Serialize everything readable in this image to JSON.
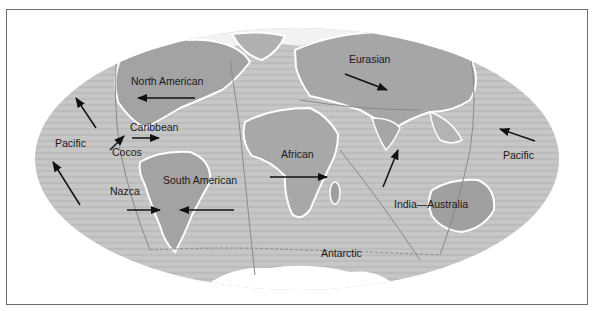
{
  "map": {
    "title": "",
    "projection": "elliptical world map of tectonic plates",
    "colors": {
      "frame_border": "#6e6e6e",
      "ocean_floor": "#c9c9c9",
      "continent": "#a9a9a9",
      "ice": "#ffffff",
      "arrow": "#111111",
      "label": "#1a1a1a"
    },
    "plates": [
      {
        "name": "North American",
        "label": "North American"
      },
      {
        "name": "Eurasian",
        "label": "Eurasian"
      },
      {
        "name": "Caribbean",
        "label": "Caribbean"
      },
      {
        "name": "Cocos",
        "label": "Cocos"
      },
      {
        "name": "Pacific (west)",
        "label": "Pacific"
      },
      {
        "name": "Pacific (east)",
        "label": "Pacific"
      },
      {
        "name": "Nazca",
        "label": "Nazca"
      },
      {
        "name": "South American",
        "label": "South American"
      },
      {
        "name": "African",
        "label": "African"
      },
      {
        "name": "India—Australia",
        "label": "India—Australia"
      },
      {
        "name": "Antarctic",
        "label": "Antarctic"
      }
    ],
    "motion_arrows": [
      {
        "plate": "North American",
        "direction": "west"
      },
      {
        "plate": "Eurasian",
        "direction": "southeast"
      },
      {
        "plate": "Pacific (west)",
        "direction": "northwest"
      },
      {
        "plate": "Pacific (west, lower)",
        "direction": "northwest"
      },
      {
        "plate": "Cocos",
        "direction": "northeast"
      },
      {
        "plate": "Caribbean",
        "direction": "east"
      },
      {
        "plate": "Nazca",
        "direction": "east"
      },
      {
        "plate": "South American",
        "direction": "west"
      },
      {
        "plate": "African",
        "direction": "east"
      },
      {
        "plate": "India—Australia",
        "direction": "north-northeast"
      },
      {
        "plate": "Pacific (east)",
        "direction": "west-northwest"
      }
    ]
  }
}
